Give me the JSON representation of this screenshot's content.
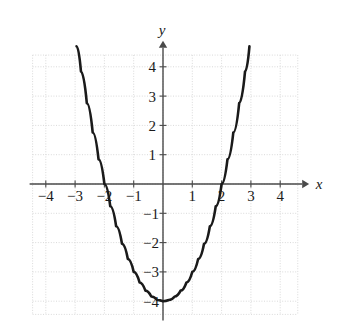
{
  "chart_data": {
    "type": "line",
    "title": "",
    "subtitle": "",
    "xlabel": "x",
    "ylabel": "y",
    "function": "y = x^2 - 4",
    "xlim": [
      -4.5,
      4.5
    ],
    "ylim": [
      -4.5,
      4.5
    ],
    "grid": true,
    "legend": null,
    "x_ticks": [
      -4,
      -3,
      -2,
      -1,
      1,
      2,
      3,
      4
    ],
    "y_ticks": [
      4,
      3,
      2,
      1,
      -1,
      -2,
      -3,
      -4
    ],
    "x_tick_labels": [
      "−4",
      "−3",
      "−2",
      "−1",
      "1",
      "2",
      "3",
      "4"
    ],
    "y_tick_labels": [
      "4",
      "3",
      "2",
      "1",
      "−1",
      "−2",
      "−3",
      "−4"
    ],
    "vertex": [
      0,
      -4
    ],
    "x_intercepts": [
      -2,
      2
    ],
    "y_intercept": -4,
    "x": [
      -2.95,
      -2.8,
      -2.6,
      -2.4,
      -2.2,
      -2.0,
      -1.8,
      -1.6,
      -1.4,
      -1.2,
      -1.0,
      -0.8,
      -0.6,
      -0.4,
      -0.2,
      0.0,
      0.2,
      0.4,
      0.6,
      0.8,
      1.0,
      1.2,
      1.4,
      1.6,
      1.8,
      2.0,
      2.2,
      2.4,
      2.6,
      2.8,
      2.95
    ],
    "y": [
      4.7,
      3.84,
      2.76,
      1.76,
      0.84,
      0.0,
      -0.76,
      -1.44,
      -2.04,
      -2.56,
      -3.0,
      -3.36,
      -3.64,
      -3.84,
      -3.96,
      -4.0,
      -3.96,
      -3.84,
      -3.64,
      -3.36,
      -3.0,
      -2.56,
      -2.04,
      -1.44,
      -0.76,
      0.0,
      0.84,
      1.76,
      2.76,
      3.84,
      4.7
    ],
    "colors": {
      "curve": "#1a1a1a",
      "axis": "#4a4a4a",
      "grid": "#d9d9d9",
      "background": "#ffffff",
      "text": "#1a1a1a"
    },
    "curve_width": 2.6,
    "axis_width": 1.4
  },
  "axis_labels": {
    "x_name": "x",
    "y_name": "y"
  }
}
